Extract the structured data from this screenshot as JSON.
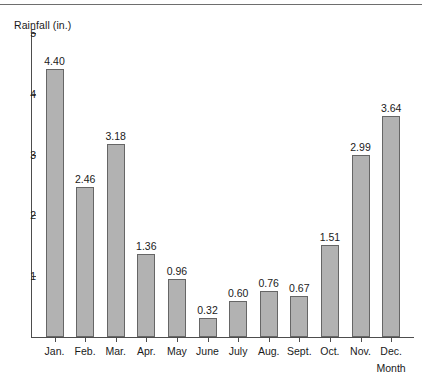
{
  "chart_data": {
    "type": "bar",
    "title": "",
    "subtitle": "",
    "xlabel": "Month",
    "ylabel": "Rainfall (in.)",
    "categories": [
      "Jan.",
      "Feb.",
      "Mar.",
      "Apr.",
      "May",
      "June",
      "July",
      "Aug.",
      "Sept.",
      "Oct.",
      "Nov.",
      "Dec."
    ],
    "values": [
      4.4,
      2.46,
      3.18,
      1.36,
      0.96,
      0.32,
      0.6,
      0.76,
      0.67,
      1.51,
      2.99,
      3.64
    ],
    "value_labels": [
      "4.40",
      "2.46",
      "3.18",
      "1.36",
      "0.96",
      "0.32",
      "0.60",
      "0.76",
      "0.67",
      "1.51",
      "2.99",
      "3.64"
    ],
    "ylim": [
      0,
      5
    ],
    "y_ticks": [
      1,
      2,
      3,
      4,
      5
    ],
    "y_tick_labels": [
      "1",
      "2",
      "3",
      "4",
      "5"
    ],
    "grid": false,
    "legend": null,
    "legend_position": "none",
    "bar_fill_color": "#b2b2b2",
    "bar_edge_color": "#666666",
    "axis_color": "#4d4d4d",
    "text_color": "#1a1a1a"
  }
}
